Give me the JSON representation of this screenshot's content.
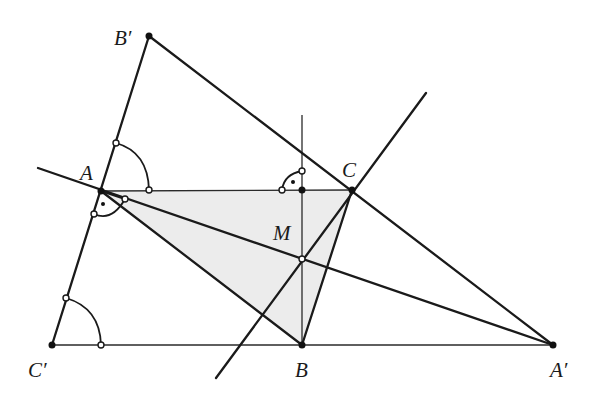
{
  "diagram": {
    "type": "geometry-construction",
    "shading_color": "#ececec",
    "line_color": "#1a1a1a",
    "points": {
      "A": {
        "label": "A",
        "x": 101,
        "y": 191
      },
      "B": {
        "label": "B",
        "x": 302,
        "y": 345
      },
      "C": {
        "label": "C",
        "x": 352,
        "y": 190
      },
      "A_prime": {
        "label": "A′",
        "x": 553,
        "y": 345
      },
      "B_prime": {
        "label": "B′",
        "x": 149,
        "y": 36
      },
      "C_prime": {
        "label": "C′",
        "x": 52,
        "y": 345
      },
      "M": {
        "label": "M",
        "x": 302,
        "y": 259
      }
    },
    "labels": {
      "A": "A",
      "B": "B",
      "C": "C",
      "A_prime": "A′",
      "B_prime": "B′",
      "C_prime": "C′",
      "M": "M"
    },
    "shaded_region": [
      "A",
      "C",
      "B"
    ],
    "annotations": {
      "right_angle_at": "foot of perpendicular from M on AC",
      "equal_angle_marks": [
        "angle B′AC",
        "angle AC′A′"
      ]
    }
  }
}
